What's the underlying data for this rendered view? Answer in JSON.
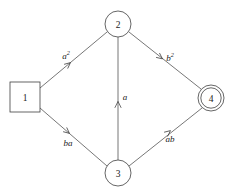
{
  "diagram": {
    "canvas": {
      "width": 239,
      "height": 193,
      "background": "#ffffff"
    },
    "stroke_color": "#3f3f3f",
    "text_color": "#222222",
    "nodes": [
      {
        "id": "1",
        "label": "1",
        "shape": "square",
        "role": "start-state",
        "cx": 25,
        "cy": 97,
        "half": 15
      },
      {
        "id": "2",
        "label": "2",
        "shape": "circle",
        "role": "state",
        "cx": 118,
        "cy": 24,
        "r": 13
      },
      {
        "id": "3",
        "label": "3",
        "shape": "circle",
        "role": "state",
        "cx": 118,
        "cy": 173,
        "r": 13
      },
      {
        "id": "4",
        "label": "4",
        "shape": "double-circle",
        "role": "accepting-state",
        "cx": 211,
        "cy": 98,
        "r": 13,
        "r_inner": 10.2
      }
    ],
    "edges": [
      {
        "id": "edge-1-2",
        "from": "1",
        "to": "2",
        "label": "a2",
        "label_base": "a",
        "label_sup": "2",
        "label_x": 67,
        "label_y": 56,
        "x1": 40,
        "y1": 88,
        "x2": 107,
        "y2": 32,
        "arrow_x": 70,
        "arrow_y": 63,
        "arrow_angle": -40
      },
      {
        "id": "edge-2-4",
        "from": "2",
        "to": "4",
        "label": "b2",
        "label_base": "b",
        "label_sup": "2",
        "label_x": 169,
        "label_y": 58,
        "x1": 129,
        "y1": 32,
        "x2": 201,
        "y2": 89,
        "arrow_x": 161,
        "arrow_y": 58,
        "arrow_angle": 38
      },
      {
        "id": "edge-1-3",
        "from": "1",
        "to": "3",
        "label": "ba",
        "label_base": "ba",
        "label_sup": "",
        "label_x": 68,
        "label_y": 143,
        "x1": 40,
        "y1": 108,
        "x2": 107,
        "y2": 166,
        "arrow_x": 68,
        "arrow_y": 132,
        "arrow_angle": 40
      },
      {
        "id": "edge-3-4",
        "from": "3",
        "to": "4",
        "label": "ab",
        "label_base": "ab",
        "label_sup": "",
        "label_x": 170,
        "label_y": 138,
        "x1": 129,
        "y1": 166,
        "x2": 202,
        "y2": 108,
        "arrow_x": 169,
        "arrow_y": 130,
        "arrow_angle": -39
      },
      {
        "id": "edge-3-2",
        "from": "3",
        "to": "2",
        "label": "a",
        "label_base": "a",
        "label_sup": "",
        "label_x": 125,
        "label_y": 97,
        "x1": 118,
        "y1": 160,
        "x2": 118,
        "y2": 37,
        "arrow_x": 118,
        "arrow_y": 102,
        "arrow_angle": -90
      }
    ]
  }
}
